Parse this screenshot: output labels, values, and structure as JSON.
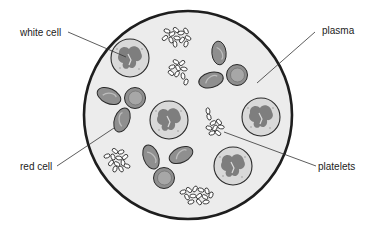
{
  "diagram": {
    "colors": {
      "background": "#ffffff",
      "plasma": "#ececec",
      "outline": "#222222",
      "red_cell_fill": "#8f8f8f",
      "red_cell_inner": "#a7a7a7",
      "white_cell_fill": "#d9d9d9",
      "white_cell_nucleus": "#7e7e7e",
      "platelet_fill": "#ffffff"
    },
    "labels": {
      "white_cell": "white cell",
      "plasma": "plasma",
      "red_cell": "red cell",
      "platelets": "platelets"
    }
  }
}
